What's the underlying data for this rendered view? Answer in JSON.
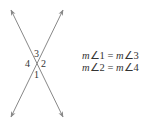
{
  "diagram": {
    "type": "vertical-angles",
    "line_color": "#888888",
    "lines": [
      {
        "name": "line-a",
        "from": [
          11,
          10
        ],
        "to": [
          63,
          117
        ]
      },
      {
        "name": "line-b",
        "from": [
          63,
          10
        ],
        "to": [
          11,
          117
        ]
      }
    ],
    "intersection": [
      37,
      63
    ],
    "angle_labels": [
      {
        "id": "3",
        "text": "3",
        "x": 34,
        "y": 57
      },
      {
        "id": "4",
        "text": "4",
        "x": 25,
        "y": 67
      },
      {
        "id": "2",
        "text": "2",
        "x": 41,
        "y": 67
      },
      {
        "id": "1",
        "text": "1",
        "x": 34,
        "y": 78
      }
    ]
  },
  "equations": [
    {
      "m": "m",
      "angle_a": "∠1",
      "eq": " = ",
      "m2": "m",
      "angle_b": "∠3"
    },
    {
      "m": "m",
      "angle_a": "∠2",
      "eq": " = ",
      "m2": "m",
      "angle_b": "∠4"
    }
  ]
}
